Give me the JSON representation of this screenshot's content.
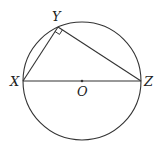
{
  "diagram": {
    "type": "geometry-circle-inscribed-triangle",
    "colors": {
      "stroke": "#333333",
      "background": "#ffffff",
      "text": "#222222"
    },
    "circle": {
      "center_label": "O",
      "cx": 82,
      "cy": 81,
      "r": 59
    },
    "points": {
      "X": {
        "label": "X",
        "x": 23,
        "y": 81
      },
      "Y": {
        "label": "Y",
        "x": 58,
        "y": 27
      },
      "Z": {
        "label": "Z",
        "x": 141,
        "y": 81
      },
      "O": {
        "label": "O",
        "x": 82,
        "y": 81
      }
    },
    "segments": [
      "XY",
      "YZ",
      "XZ"
    ],
    "right_angle_at": "Y"
  }
}
